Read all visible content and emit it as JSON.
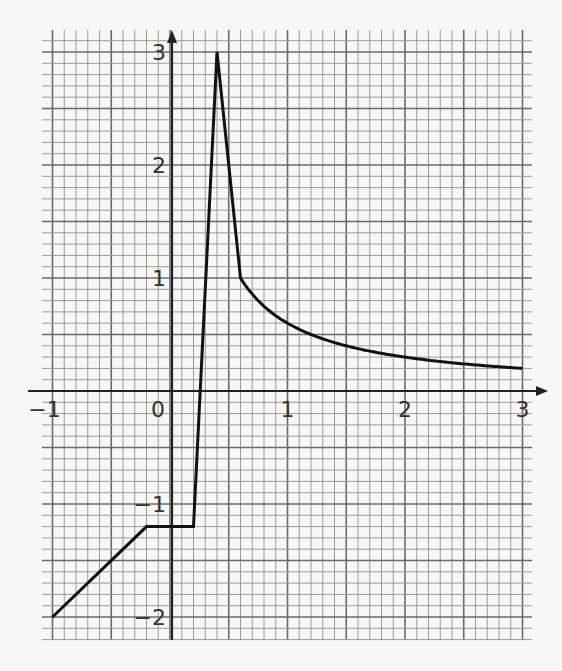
{
  "chart_data": {
    "type": "line",
    "title": "",
    "xlabel": "",
    "ylabel": "",
    "xlim": [
      -1.1,
      3.15
    ],
    "ylim": [
      -2.25,
      3.3
    ],
    "grid": true,
    "minor_grid_step": 0.1,
    "major_grid_step": 0.5,
    "x_ticks": [
      "-1",
      "0",
      "1",
      "2",
      "3"
    ],
    "y_ticks": [
      "3",
      "2",
      "1",
      "-1",
      "-2"
    ],
    "series": [
      {
        "name": "f(x)",
        "segments": [
          {
            "kind": "linear",
            "points": [
              [
                -1,
                -2
              ],
              [
                -0.2,
                -1.2
              ]
            ]
          },
          {
            "kind": "linear",
            "points": [
              [
                -0.2,
                -1.2
              ],
              [
                0.2,
                -1.2
              ]
            ]
          },
          {
            "kind": "linear",
            "points": [
              [
                0.2,
                -1.2
              ],
              [
                0.4,
                3
              ]
            ]
          },
          {
            "kind": "linear",
            "points": [
              [
                0.4,
                3
              ],
              [
                0.6,
                1
              ]
            ]
          },
          {
            "kind": "curve",
            "formula": "0.6/x",
            "points": [
              [
                0.6,
                1
              ],
              [
                0.75,
                0.8
              ],
              [
                1,
                0.6
              ],
              [
                1.5,
                0.4
              ],
              [
                2,
                0.3
              ],
              [
                2.5,
                0.24
              ],
              [
                3,
                0.2
              ]
            ]
          }
        ]
      }
    ],
    "colors": {
      "line": "#111111",
      "axis": "#222222",
      "grid_minor": "#9a9a9a",
      "grid_major": "#6a6a6a",
      "paper": "#f7f7f5"
    }
  }
}
